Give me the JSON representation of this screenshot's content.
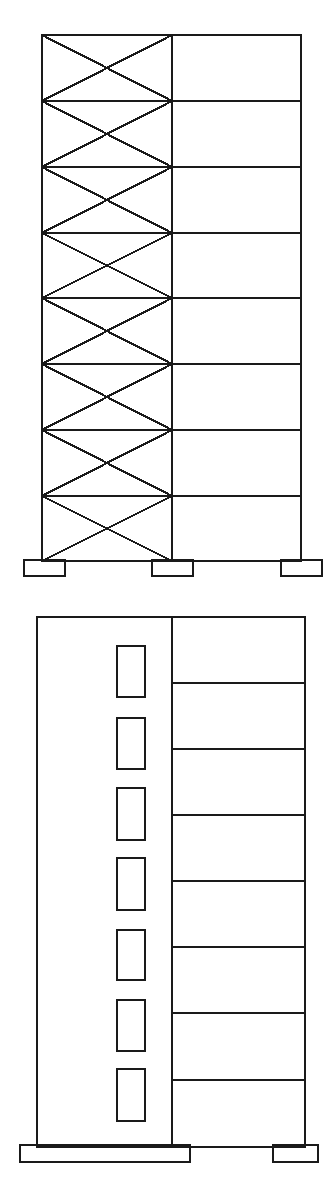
{
  "figure": {
    "canvas": {
      "width": 333,
      "height": 1197,
      "background": "#ffffff"
    },
    "line_color": "#1a1a1a",
    "fill_color": "none"
  },
  "diagrams": [
    {
      "id": "braced-frame-elevation",
      "name": "Braced frame elevation",
      "label": "",
      "frame": {
        "left": 42,
        "right": 301,
        "top": 35,
        "bottom": 561,
        "mid_column_x": 172
      },
      "story_count": 8,
      "floor_levels": [
        35,
        101,
        167,
        233,
        298,
        364,
        430,
        496,
        561
      ],
      "braced_bay": {
        "left": 42,
        "right": 172,
        "bracing": "X",
        "bay_index": 0
      },
      "open_bay": {
        "left": 172,
        "right": 301,
        "bracing": "none",
        "bay_index": 1
      },
      "columns_x": [
        42,
        172,
        301
      ],
      "footings": [
        {
          "name": "left-footing",
          "x": 24,
          "y": 560,
          "width": 41,
          "height": 16
        },
        {
          "name": "middle-footing",
          "x": 152,
          "y": 560,
          "width": 41,
          "height": 16
        },
        {
          "name": "right-footing",
          "x": 281,
          "y": 560,
          "width": 41,
          "height": 16
        }
      ]
    },
    {
      "id": "shear-wall-elevation",
      "name": "Shear wall elevation",
      "label": "",
      "frame": {
        "left": 37,
        "right": 305,
        "top": 617,
        "bottom": 1147,
        "mid_column_x": 172
      },
      "story_count": 8,
      "floor_levels": [
        617,
        683,
        749,
        815,
        881,
        947,
        1013,
        1080,
        1147
      ],
      "shear_wall": {
        "left": 37,
        "right": 172,
        "top": 617,
        "bottom": 1147,
        "solid": true
      },
      "open_bay": {
        "left": 172,
        "right": 305,
        "bracing": "none"
      },
      "wall_openings": [
        {
          "x": 117,
          "y": 646,
          "width": 28,
          "height": 51
        },
        {
          "x": 117,
          "y": 718,
          "width": 28,
          "height": 51
        },
        {
          "x": 117,
          "y": 788,
          "width": 28,
          "height": 52
        },
        {
          "x": 117,
          "y": 858,
          "width": 28,
          "height": 52
        },
        {
          "x": 117,
          "y": 930,
          "width": 28,
          "height": 50
        },
        {
          "x": 117,
          "y": 1000,
          "width": 28,
          "height": 51
        },
        {
          "x": 117,
          "y": 1069,
          "width": 28,
          "height": 52
        }
      ],
      "footings": [
        {
          "name": "mat-footing",
          "x": 20,
          "y": 1145,
          "width": 170,
          "height": 17
        },
        {
          "name": "right-footing",
          "x": 273,
          "y": 1145,
          "width": 45,
          "height": 17
        }
      ]
    }
  ]
}
